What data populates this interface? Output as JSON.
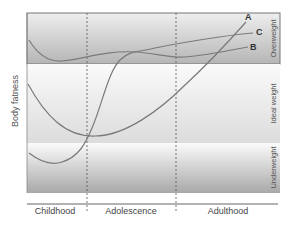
{
  "diagram": {
    "y_axis_label": "Body fatness",
    "bands": [
      {
        "name": "Overweight",
        "label": "Overweight"
      },
      {
        "name": "Ideal weight",
        "label": "Ideal weight"
      },
      {
        "name": "Underweight",
        "label": "Underweight"
      }
    ],
    "phases": [
      {
        "label": "Childhood"
      },
      {
        "label": "Adolescence"
      },
      {
        "label": "Adulthood"
      }
    ],
    "curves": [
      {
        "id": "A",
        "label": "A",
        "description": "Starts in ideal weight range, drops through childhood, rises steadily through adolescence and adulthood into overweight"
      },
      {
        "id": "B",
        "label": "B",
        "description": "Remains in overweight range throughout life"
      },
      {
        "id": "C",
        "label": "C",
        "description": "Starts underweight, rises steeply during adolescence into overweight"
      }
    ],
    "colors": {
      "curve": "#7a7a7a",
      "band_dark": "#a9a9a9",
      "band_light": "#f2f2f2",
      "border": "#666666"
    }
  }
}
